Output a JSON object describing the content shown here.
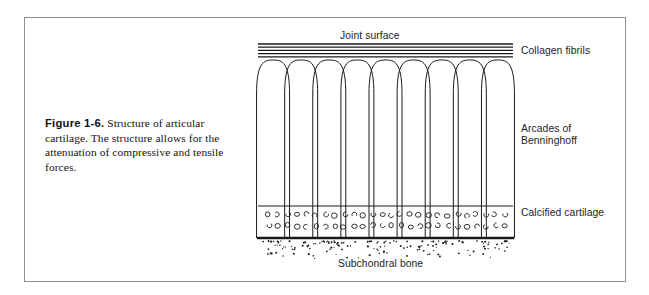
{
  "figure": {
    "caption_number": "Figure 1-6.",
    "caption_text": " Structure of articular cartilage. The structure allows for the attenuation of compressive and tensile forces.",
    "border_color": "#8d8d8d",
    "ink_color": "#1a1a1a"
  },
  "labels": {
    "joint_surface": "Joint surface",
    "collagen_fibrils": "Collagen fibrils",
    "arcades": "Arcades of\nBenninghoff",
    "calcified_cartilage": "Calcified cartilage",
    "subchondral_bone": "Subchondral bone"
  },
  "diagram": {
    "width": 268,
    "height": 225,
    "left": 9,
    "right": 262,
    "collagen_band": {
      "top": 8,
      "line_count": 5,
      "line_gap": 3.2,
      "line_width": 1.3,
      "color": "#1a1a1a"
    },
    "arcades": {
      "count": 9,
      "top": 24,
      "bottom": 170,
      "arch_height": 34,
      "half_width": 16.5,
      "stroke": 1.0,
      "color": "#1a1a1a"
    },
    "calcified_zone": {
      "top": 170,
      "bottom": 202,
      "top_rule_width": 1.2,
      "bottom_rule_width": 2.6,
      "color": "#1a1a1a",
      "cell_rows": 2,
      "cells_per_row": 26,
      "cell_radius": 2.4
    },
    "subchondral_bone": {
      "top": 204,
      "bottom": 222,
      "stipple_count": 150,
      "dot_radius": 0.75,
      "color": "#1a1a1a"
    }
  }
}
